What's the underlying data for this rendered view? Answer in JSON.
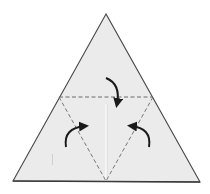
{
  "diagram": {
    "colors": {
      "background": "#ffffff",
      "paper_fill": "#ebebeb",
      "outline": "#4a4a4a",
      "fold_line": "#6a6a6a",
      "arrow": "#1a1a1a",
      "crease": "#ffffff"
    },
    "outer_triangle": {
      "apex": [
        106,
        14
      ],
      "bottom_left": [
        13,
        181
      ],
      "bottom_right": [
        200,
        182
      ]
    },
    "fold_lines": [
      {
        "name": "top-horizontal-fold",
        "from": [
          59,
          97
        ],
        "to": [
          153,
          97
        ],
        "style": "dashed"
      },
      {
        "name": "left-diagonal-fold",
        "from": [
          59,
          97
        ],
        "to": [
          106,
          181
        ],
        "style": "dashed"
      },
      {
        "name": "right-diagonal-fold",
        "from": [
          153,
          97
        ],
        "to": [
          106,
          181
        ],
        "style": "dashed"
      }
    ],
    "arrows": [
      {
        "name": "top-fold-arrow",
        "direction": "fold top corner down"
      },
      {
        "name": "left-fold-arrow",
        "direction": "fold left corner toward center"
      },
      {
        "name": "right-fold-arrow",
        "direction": "fold right corner toward center"
      }
    ]
  }
}
